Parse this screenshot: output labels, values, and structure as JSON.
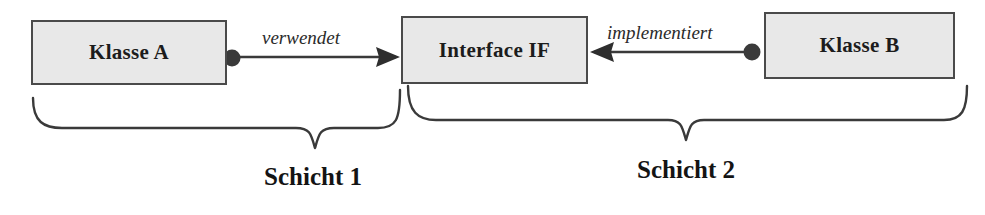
{
  "diagram": {
    "nodes": [
      {
        "id": "klasse-a",
        "label": "Klasse A",
        "x": 31,
        "y": 20,
        "w": 196,
        "h": 65
      },
      {
        "id": "interface-if",
        "label": "Interface IF",
        "x": 401,
        "y": 16,
        "w": 187,
        "h": 68
      },
      {
        "id": "klasse-b",
        "label": "Klasse B",
        "x": 764,
        "y": 12,
        "w": 191,
        "h": 67
      }
    ],
    "edges": [
      {
        "id": "verwendet-edge",
        "label": "verwendet",
        "from": "klasse-a",
        "to": "interface-if",
        "direction": "right",
        "source_dot": true,
        "label_x": 262,
        "label_y": 27,
        "line_y": 57,
        "line_x1": 238,
        "line_x2": 398,
        "dot_x": 232,
        "dot_y": 58
      },
      {
        "id": "implementiert-edge",
        "label": "implementiert",
        "from": "klasse-b",
        "to": "interface-if",
        "direction": "left",
        "source_dot": true,
        "label_x": 607,
        "label_y": 22,
        "line_y": 52,
        "line_x1": 592,
        "line_x2": 748,
        "dot_x": 752,
        "dot_y": 52
      }
    ],
    "braces": [
      {
        "id": "brace-schicht-1",
        "label": "Schicht 1",
        "x_left": 32,
        "x_right": 400,
        "y_top": 98,
        "y_mid": 128,
        "y_point": 148,
        "label_center_x": 313,
        "label_y": 163
      },
      {
        "id": "brace-schicht-2",
        "label": "Schicht 2",
        "x_left": 406,
        "x_right": 968,
        "y_top": 86,
        "y_mid": 120,
        "y_point": 140,
        "label_center_x": 686,
        "label_y": 156
      }
    ],
    "colors": {
      "box_fill": "#e8e8e8",
      "box_border": "#4a4a4a",
      "line": "#3a3a3a",
      "text": "#1c1c1c",
      "background": "#ffffff"
    }
  }
}
